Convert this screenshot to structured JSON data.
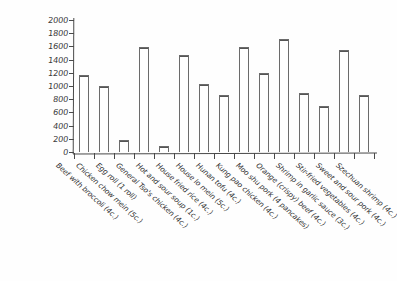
{
  "chart_data": {
    "type": "bar",
    "title": "",
    "subtitle": "",
    "xlabel": "",
    "ylabel": "",
    "ylim": [
      0,
      2000
    ],
    "grid": false,
    "legend": "none",
    "ytick_labels": [
      "0",
      "200",
      "400",
      "600",
      "800",
      "1000",
      "1200",
      "1400",
      "1600",
      "1800",
      "2000"
    ],
    "ytick_values": [
      0,
      200,
      400,
      600,
      800,
      1000,
      1200,
      1400,
      1600,
      1800,
      2000
    ],
    "categories": [
      "Beef with broccoli (4c.)",
      "Chicken chow mein (5c.)",
      "Egg roll (1 roll)",
      "General Tso's chicken (4c.)",
      "Hot and sour soup (1c.)",
      "House fried rice (4c.)",
      "House lo mein (5c.)",
      "Hunan tofu (4c.)",
      "Kung pao chicken (4c.)",
      "Moo shu pork (4 pancakes)",
      "Orange (crispy) beef (4c.)",
      "Shrimp in garlic sauce (3c.)",
      "Stir-fried vegetables (4c.)",
      "Sweet and sour pork (4c.)",
      "Szechuan shrimp (4c.)"
    ],
    "values": [
      1170,
      1000,
      180,
      1590,
      90,
      1470,
      1030,
      870,
      1590,
      1200,
      1710,
      900,
      700,
      1550,
      860
    ],
    "bar_style": {
      "fill": "#ffffff",
      "outline": "#6b6b6b"
    },
    "axis_color": "#4a4a4a",
    "text_color": "#2f2f2f"
  }
}
